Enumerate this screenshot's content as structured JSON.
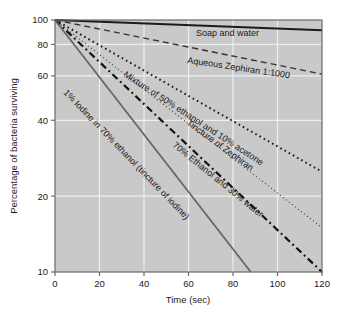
{
  "chart_data": {
    "type": "line",
    "title": "",
    "xlabel": "Time (sec)",
    "ylabel": "Percentage of bacteria surviving",
    "xlim": [
      0,
      120
    ],
    "ylim": [
      10,
      100
    ],
    "yscale": "log",
    "grid": true,
    "legend": "inline-labels",
    "xticks": [
      "0",
      "20",
      "40",
      "60",
      "80",
      "100",
      "120"
    ],
    "xtick_values": [
      0,
      20,
      40,
      60,
      80,
      100,
      120
    ],
    "yticks": [
      "100",
      "80",
      "60",
      "40",
      "20",
      "10"
    ],
    "ytick_values": [
      100,
      80,
      60,
      40,
      20,
      10
    ],
    "plot_background": "#c9c9c9",
    "grid_color": "#efefef",
    "axis_color": "#6b6b6b",
    "series": [
      {
        "name": "Soap and water",
        "label": "Soap and water",
        "style": "solid",
        "color": "#1a1a1a",
        "width": 2.0,
        "x": [
          0,
          120
        ],
        "values": [
          100,
          91
        ]
      },
      {
        "name": "Aqueous Zephiran 1:1000",
        "label": "Aqueous Zephiran 1:1000",
        "style": "dashed",
        "color": "#333333",
        "width": 1.4,
        "x": [
          0,
          120
        ],
        "values": [
          100,
          61
        ]
      },
      {
        "name": "Mixture of 50% ethanol and 10% acetone",
        "label": "Mixture of 50% ethanol and 10% acetone",
        "style": "dotted-bold",
        "color": "#1a1a1a",
        "width": 2.0,
        "x": [
          0,
          120
        ],
        "values": [
          100,
          25
        ]
      },
      {
        "name": "Tincture of Zephiran",
        "label": "Tincture of Zephiran",
        "style": "fine-dotted",
        "color": "#555555",
        "width": 1.2,
        "x": [
          0,
          120
        ],
        "values": [
          100,
          15
        ]
      },
      {
        "name": "70% Ethanol and 30% water",
        "label": "70% Ethanol and 30% water",
        "style": "dash-dot",
        "color": "#111111",
        "width": 2.2,
        "x": [
          0,
          120
        ],
        "values": [
          100,
          10
        ]
      },
      {
        "name": "1% Iodine in 70% ethanol (tincture of iodine)",
        "label": "1% Iodine in 70% ethanol (tincture of iodine)",
        "style": "solid-gray",
        "color": "#666666",
        "width": 1.8,
        "x": [
          0,
          88
        ],
        "values": [
          100,
          10
        ]
      }
    ]
  },
  "labels": {
    "soap": "Soap and water",
    "zephiran_aq": "Aqueous Zephiran 1:1000",
    "mixture": "Mixture of 50% ethanol and 10% acetone",
    "zephiran_tinct": "Tincture of Zephiran",
    "ethanol70": "70% Ethanol and 30% water",
    "iodine": "1% Iodine in 70% ethanol (tincture of iodine)"
  },
  "axes": {
    "x_title": "Time (sec)",
    "y_title": "Percentage of bacteria surviving",
    "x_ticks": [
      "0",
      "20",
      "40",
      "60",
      "80",
      "100",
      "120"
    ],
    "y_ticks": [
      "100",
      "80",
      "60",
      "40",
      "20",
      "10"
    ]
  }
}
